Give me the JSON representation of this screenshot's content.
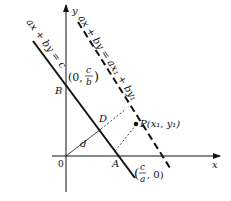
{
  "diagram": {
    "axes": {
      "x_label": "x",
      "y_label": "y",
      "origin_label": "0"
    },
    "lines": {
      "solid_equation": "ax + by = c",
      "dashed_equation": "ax + by = ax₁ + by₁"
    },
    "points": {
      "B": "B",
      "A": "A",
      "D": "D",
      "P": "P(x₁, y₁)",
      "B_coord_open": "(0,",
      "B_coord_num": "c",
      "B_coord_den": "b",
      "B_coord_close": ")",
      "A_coord_open": "(",
      "A_coord_num": "c",
      "A_coord_den": "a",
      "A_coord_close": ", 0)"
    },
    "distance_label": "d",
    "colors": {
      "ink": "#111111",
      "background": "#ffffff"
    }
  }
}
